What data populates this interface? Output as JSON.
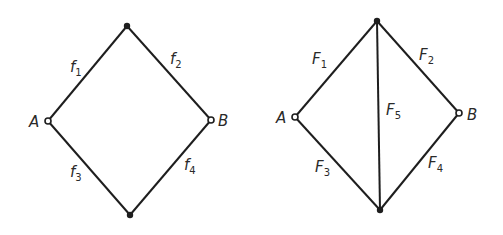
{
  "diagrams": [
    {
      "name": "left-network",
      "nodes": {
        "A": {
          "label": "A",
          "x": 48,
          "y": 121,
          "type": "open"
        },
        "B": {
          "label": "B",
          "x": 211,
          "y": 120,
          "type": "open"
        },
        "top": {
          "x": 127,
          "y": 26,
          "type": "filled"
        },
        "bottom": {
          "x": 130,
          "y": 215,
          "type": "filled"
        }
      },
      "edges": [
        {
          "base": "f",
          "sub": "1",
          "from": "A",
          "to": "top"
        },
        {
          "base": "f",
          "sub": "2",
          "from": "top",
          "to": "B"
        },
        {
          "base": "f",
          "sub": "3",
          "from": "A",
          "to": "bottom"
        },
        {
          "base": "f",
          "sub": "4",
          "from": "bottom",
          "to": "B"
        }
      ]
    },
    {
      "name": "right-network",
      "nodes": {
        "A": {
          "label": "A",
          "x": 295,
          "y": 117,
          "type": "open"
        },
        "B": {
          "label": "B",
          "x": 459,
          "y": 113,
          "type": "open"
        },
        "top": {
          "x": 377,
          "y": 21,
          "type": "filled"
        },
        "bottom": {
          "x": 380,
          "y": 210,
          "type": "filled"
        }
      },
      "edges": [
        {
          "base": "F",
          "sub": "1",
          "from": "A",
          "to": "top"
        },
        {
          "base": "F",
          "sub": "2",
          "from": "top",
          "to": "B"
        },
        {
          "base": "F",
          "sub": "3",
          "from": "A",
          "to": "bottom"
        },
        {
          "base": "F",
          "sub": "4",
          "from": "bottom",
          "to": "B"
        },
        {
          "base": "F",
          "sub": "5",
          "from": "top",
          "to": "bottom"
        }
      ]
    }
  ]
}
